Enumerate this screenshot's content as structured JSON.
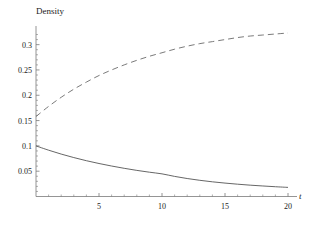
{
  "chart_data": {
    "type": "line",
    "title": "",
    "xlabel": "t",
    "ylabel": "Density",
    "xlim": [
      0,
      20.5
    ],
    "ylim": [
      0,
      0.335
    ],
    "grid": false,
    "legend": "none",
    "xticks": [
      5,
      10,
      15,
      20
    ],
    "xtick_labels": [
      "5",
      "10",
      "15",
      "20"
    ],
    "yticks": [
      0.05,
      0.1,
      0.15,
      0.2,
      0.25,
      0.3
    ],
    "ytick_labels": [
      "0.05",
      "0.1",
      "0.15",
      "0.2",
      "0.25",
      "0.3"
    ],
    "series": [
      {
        "name": "decaying-density",
        "style": "solid",
        "color": "#555555",
        "x": [
          0,
          1,
          2,
          3,
          4,
          5,
          6,
          7,
          8,
          9,
          10,
          11,
          12,
          13,
          14,
          15,
          16,
          17,
          18,
          19,
          20
        ],
        "values": [
          0.1,
          0.0915,
          0.0838,
          0.0769,
          0.0707,
          0.0652,
          0.0602,
          0.0557,
          0.0516,
          0.048,
          0.0447,
          0.0397,
          0.0355,
          0.032,
          0.029,
          0.0265,
          0.0243,
          0.0224,
          0.0208,
          0.0193,
          0.018
        ]
      },
      {
        "name": "rising-density",
        "style": "dashed",
        "color": "#6b6b6b",
        "x": [
          0,
          1,
          2,
          3,
          4,
          5,
          6,
          7,
          8,
          9,
          10,
          11,
          12,
          13,
          14,
          15,
          16,
          17,
          18,
          19,
          20
        ],
        "values": [
          0.158,
          0.178,
          0.196,
          0.212,
          0.226,
          0.239,
          0.25,
          0.26,
          0.269,
          0.277,
          0.284,
          0.291,
          0.297,
          0.302,
          0.306,
          0.31,
          0.314,
          0.317,
          0.319,
          0.321,
          0.323
        ]
      }
    ]
  },
  "axes": {
    "y_axis_label": "Density",
    "x_axis_label": "t"
  },
  "colors": {
    "axis": "#7a7a7a",
    "solid_curve": "#555555",
    "dashed_curve": "#6b6b6b",
    "background": "#ffffff",
    "text": "#1a1a1a"
  }
}
